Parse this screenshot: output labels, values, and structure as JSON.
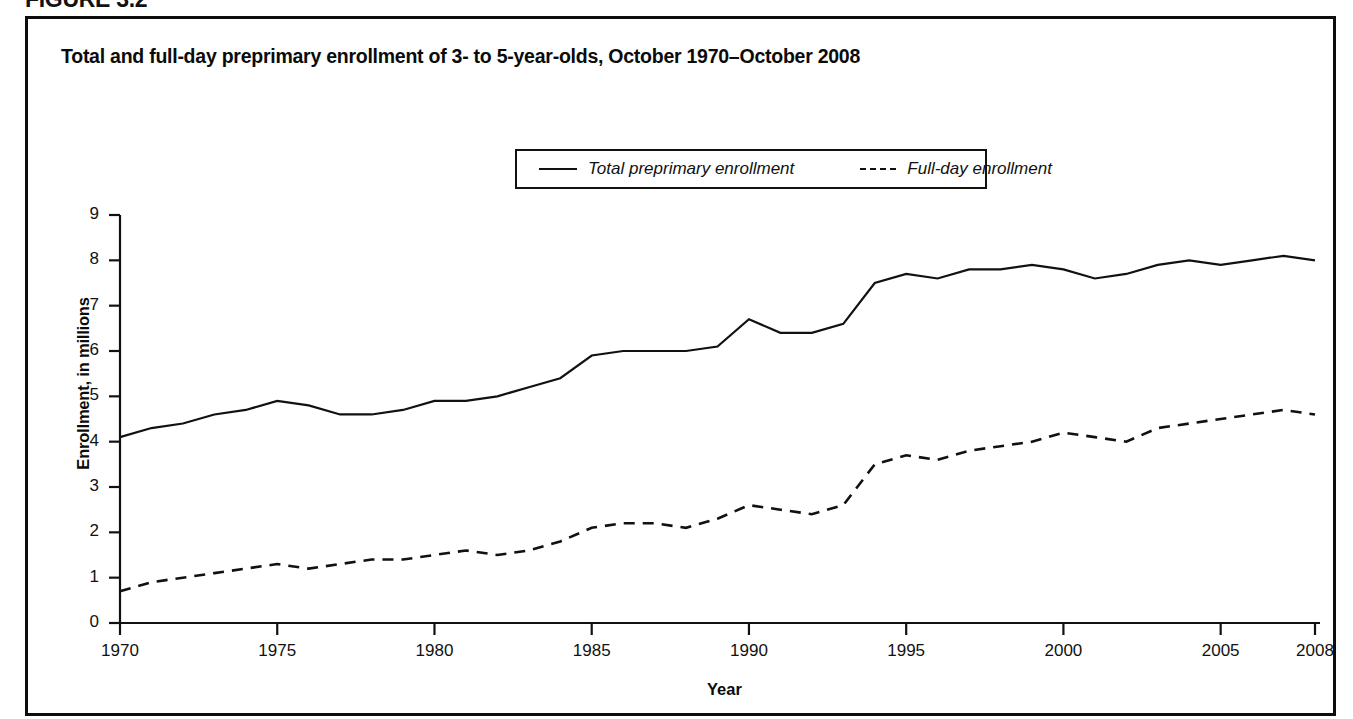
{
  "figure": {
    "label": "FIGURE 3.2"
  },
  "chart_title": "Total and full-day preprimary enrollment of 3- to 5-year-olds, October 1970–October 2008",
  "legend": {
    "position": "top-center-inside",
    "entries": [
      {
        "label": "Total preprimary enrollment",
        "style": "solid"
      },
      {
        "label": "Full-day enrollment",
        "style": "dashed"
      }
    ]
  },
  "axes": {
    "x_title": "Year",
    "y_title": "Enrollment, in millions",
    "x_ticks": [
      "1970",
      "1975",
      "1980",
      "1985",
      "1990",
      "1995",
      "2000",
      "2005",
      "2008"
    ],
    "y_ticks": [
      "0",
      "1",
      "2",
      "3",
      "4",
      "5",
      "6",
      "7",
      "8",
      "9"
    ]
  },
  "chart_data": {
    "type": "line",
    "title": "Total and full-day preprimary enrollment of 3- to 5-year-olds, October 1970–October 2008",
    "xlabel": "Year",
    "ylabel": "Enrollment, in millions",
    "xlim": [
      1970,
      2008
    ],
    "ylim": [
      0,
      9
    ],
    "grid": false,
    "legend_position": "upper center",
    "x": [
      1970,
      1971,
      1972,
      1973,
      1974,
      1975,
      1976,
      1977,
      1978,
      1979,
      1980,
      1981,
      1982,
      1983,
      1984,
      1985,
      1986,
      1987,
      1988,
      1989,
      1990,
      1991,
      1992,
      1993,
      1994,
      1995,
      1996,
      1997,
      1998,
      1999,
      2000,
      2001,
      2002,
      2003,
      2004,
      2005,
      2006,
      2007,
      2008
    ],
    "series": [
      {
        "name": "Total preprimary enrollment",
        "style": "solid",
        "values": [
          4.1,
          4.3,
          4.4,
          4.6,
          4.7,
          4.9,
          4.8,
          4.6,
          4.6,
          4.7,
          4.9,
          4.9,
          5.0,
          5.2,
          5.4,
          5.9,
          6.0,
          6.0,
          6.0,
          6.1,
          6.7,
          6.4,
          6.4,
          6.6,
          7.5,
          7.7,
          7.6,
          7.8,
          7.8,
          7.9,
          7.8,
          7.6,
          7.7,
          7.9,
          8.0,
          7.9,
          8.0,
          8.1,
          8.0
        ]
      },
      {
        "name": "Full-day enrollment",
        "style": "dashed",
        "values": [
          0.7,
          0.9,
          1.0,
          1.1,
          1.2,
          1.3,
          1.2,
          1.3,
          1.4,
          1.4,
          1.5,
          1.6,
          1.5,
          1.6,
          1.8,
          2.1,
          2.2,
          2.2,
          2.1,
          2.3,
          2.6,
          2.5,
          2.4,
          2.6,
          3.5,
          3.7,
          3.6,
          3.8,
          3.9,
          4.0,
          4.2,
          4.1,
          4.0,
          4.3,
          4.4,
          4.5,
          4.6,
          4.7,
          4.6
        ]
      }
    ]
  },
  "colors": {
    "line": "#111111",
    "frame": "#0d0d0d",
    "background": "#ffffff"
  }
}
